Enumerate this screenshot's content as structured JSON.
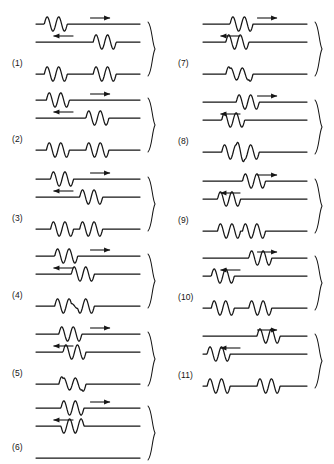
{
  "figure": {
    "stroke_color": "#161616",
    "background_color": "#ffffff",
    "columns": 2,
    "panel_count": 11
  },
  "legend": {
    "right_arrow_glyph": "→",
    "left_arrow_glyph": "←",
    "brace_glyph": "}"
  },
  "chart_data": {
    "type": "line",
    "xlabel": "",
    "ylabel": "",
    "grid": false,
    "legend_position": "none",
    "baseline_amplitude": 1
  },
  "panels": [
    {
      "id": "panel-1",
      "label": "(1)",
      "column": "left",
      "row": 1,
      "top_wave": {
        "direction": "right",
        "arrow": "→",
        "pulse_start_frac": 0.08,
        "pulse_cycles": 2,
        "amplitude": 1,
        "description": "two-cycle wave packet at left of upper line, moving right"
      },
      "bottom_wave": {
        "direction": "left",
        "arrow": "←",
        "pulse_start_frac": 0.55,
        "pulse_cycles": 2,
        "amplitude": 1,
        "description": "two-cycle wave packet at right of lower line, moving left"
      },
      "resultant": {
        "description": "pulses still separated, no overlap; four humps with flat gap between pairs",
        "peak_amplitude": 1,
        "interference": "none"
      }
    },
    {
      "id": "panel-2",
      "label": "(2)",
      "column": "left",
      "row": 2,
      "top_wave": {
        "direction": "right",
        "arrow": "→",
        "pulse_start_frac": 0.1,
        "pulse_cycles": 2,
        "amplitude": 1,
        "description": "wave packet moving right, advanced slightly"
      },
      "bottom_wave": {
        "direction": "left",
        "arrow": "←",
        "pulse_start_frac": 0.48,
        "pulse_cycles": 2,
        "amplitude": 1,
        "description": "wave packet moving left, advanced slightly"
      },
      "resultant": {
        "description": "packets approaching; small dip where edges begin to meet",
        "peak_amplitude": 1,
        "interference": "beginning-overlap"
      }
    },
    {
      "id": "panel-3",
      "label": "(3)",
      "column": "left",
      "row": 3,
      "top_wave": {
        "direction": "right",
        "arrow": "→",
        "pulse_start_frac": 0.14,
        "pulse_cycles": 2,
        "amplitude": 1,
        "description": "wave packet moving right"
      },
      "bottom_wave": {
        "direction": "left",
        "arrow": "←",
        "pulse_start_frac": 0.42,
        "pulse_cycles": 2,
        "amplitude": 1,
        "description": "wave packet moving left"
      },
      "resultant": {
        "description": "partial overlap; central trough deepened by addition",
        "peak_amplitude": 1.5,
        "interference": "partial-constructive"
      }
    },
    {
      "id": "panel-4",
      "label": "(4)",
      "column": "left",
      "row": 4,
      "top_wave": {
        "direction": "right",
        "arrow": "→",
        "pulse_start_frac": 0.18,
        "pulse_cycles": 2,
        "amplitude": 1,
        "description": "wave packet moving right, nearly centred"
      },
      "bottom_wave": {
        "direction": "left",
        "arrow": "←",
        "pulse_start_frac": 0.34,
        "pulse_cycles": 2,
        "amplitude": 1,
        "description": "wave packet moving left, nearly centred"
      },
      "resultant": {
        "description": "strong overlap with cancellation; reduced shallow humps remain",
        "peak_amplitude": 0.55,
        "interference": "partial-destructive"
      }
    },
    {
      "id": "panel-5",
      "label": "(5)",
      "column": "left",
      "row": 5,
      "top_wave": {
        "direction": "right",
        "arrow": "→",
        "pulse_start_frac": 0.22,
        "pulse_cycles": 2,
        "amplitude": 1,
        "description": "wave packet moving right, centred"
      },
      "bottom_wave": {
        "direction": "left",
        "arrow": "←",
        "pulse_start_frac": 0.26,
        "pulse_cycles": 2,
        "amplitude": 1,
        "description": "wave packet moving left, centred"
      },
      "resultant": {
        "description": "near-total overlap in phase; large doubled amplitude burst at centre",
        "peak_amplitude": 2,
        "interference": "constructive"
      }
    },
    {
      "id": "panel-6",
      "label": "(6)",
      "column": "left",
      "row": 6,
      "top_wave": {
        "direction": "right",
        "arrow": "→",
        "pulse_start_frac": 0.24,
        "pulse_cycles": 2,
        "amplitude": 1,
        "description": "wave packet moving right, fully overlapped"
      },
      "bottom_wave": {
        "direction": "left",
        "arrow": "←",
        "pulse_start_frac": 0.24,
        "pulse_cycles": 2,
        "amplitude": -1,
        "description": "inverted wave packet moving left, fully overlapped"
      },
      "resultant": {
        "description": "complete cancellation; the resultant is a perfectly straight flat line",
        "peak_amplitude": 0,
        "interference": "total-destructive"
      }
    },
    {
      "id": "panel-7",
      "label": "(7)",
      "column": "right",
      "row": 1,
      "top_wave": {
        "direction": "right",
        "arrow": "→",
        "pulse_start_frac": 0.26,
        "pulse_cycles": 2,
        "amplitude": 1,
        "description": "wave packet centred, moving right"
      },
      "bottom_wave": {
        "direction": "left",
        "arrow": "←",
        "pulse_start_frac": 0.22,
        "pulse_cycles": 2,
        "amplitude": 1,
        "description": "wave packet centred, moving left"
      },
      "resultant": {
        "description": "waves coincide in phase; tall narrow doubled oscillation at centre",
        "peak_amplitude": 2,
        "interference": "constructive"
      }
    },
    {
      "id": "panel-8",
      "label": "(8)",
      "column": "right",
      "row": 2,
      "top_wave": {
        "direction": "right",
        "arrow": "→",
        "pulse_start_frac": 0.32,
        "pulse_cycles": 2,
        "amplitude": 1,
        "description": "wave packet moving right, past centre"
      },
      "bottom_wave": {
        "direction": "left",
        "arrow": "←",
        "pulse_start_frac": 0.18,
        "pulse_cycles": 2,
        "amplitude": 1,
        "description": "wave packet moving left, past centre"
      },
      "resultant": {
        "description": "waves separating again; reduced shallow humps and troughs",
        "peak_amplitude": 0.6,
        "interference": "partial-destructive"
      }
    },
    {
      "id": "panel-9",
      "label": "(9)",
      "column": "right",
      "row": 3,
      "top_wave": {
        "direction": "right",
        "arrow": "→",
        "pulse_start_frac": 0.38,
        "pulse_cycles": 2,
        "amplitude": 1,
        "description": "wave packet moving right, separating"
      },
      "bottom_wave": {
        "direction": "left",
        "arrow": "←",
        "pulse_start_frac": 0.14,
        "pulse_cycles": 2,
        "amplitude": 1,
        "description": "wave packet moving left, separating"
      },
      "resultant": {
        "description": "partial overlap remains; central peaks taller than the outer ones",
        "peak_amplitude": 1.5,
        "interference": "partial-constructive"
      }
    },
    {
      "id": "panel-10",
      "label": "(10)",
      "column": "right",
      "row": 4,
      "top_wave": {
        "direction": "right",
        "arrow": "→",
        "pulse_start_frac": 0.44,
        "pulse_cycles": 2,
        "amplitude": 1,
        "description": "wave packet moving right, nearly clear"
      },
      "bottom_wave": {
        "direction": "left",
        "arrow": "←",
        "pulse_start_frac": 0.08,
        "pulse_cycles": 2,
        "amplitude": 1,
        "description": "wave packet moving left, nearly clear"
      },
      "resultant": {
        "description": "packets nearly separated; a continuous run of equal humps",
        "peak_amplitude": 1,
        "interference": "minimal"
      }
    },
    {
      "id": "panel-11",
      "label": "(11)",
      "column": "right",
      "row": 5,
      "top_wave": {
        "direction": "right",
        "arrow": "→",
        "pulse_start_frac": 0.52,
        "pulse_cycles": 2,
        "amplitude": 1,
        "description": "wave packet fully past, moving right"
      },
      "bottom_wave": {
        "direction": "left",
        "arrow": "←",
        "pulse_start_frac": 0.04,
        "pulse_cycles": 2,
        "amplitude": 1,
        "description": "wave packet fully past, moving left"
      },
      "resultant": {
        "description": "pulses fully separated again; two distinct packets with a gap between",
        "peak_amplitude": 1,
        "interference": "none"
      }
    }
  ]
}
